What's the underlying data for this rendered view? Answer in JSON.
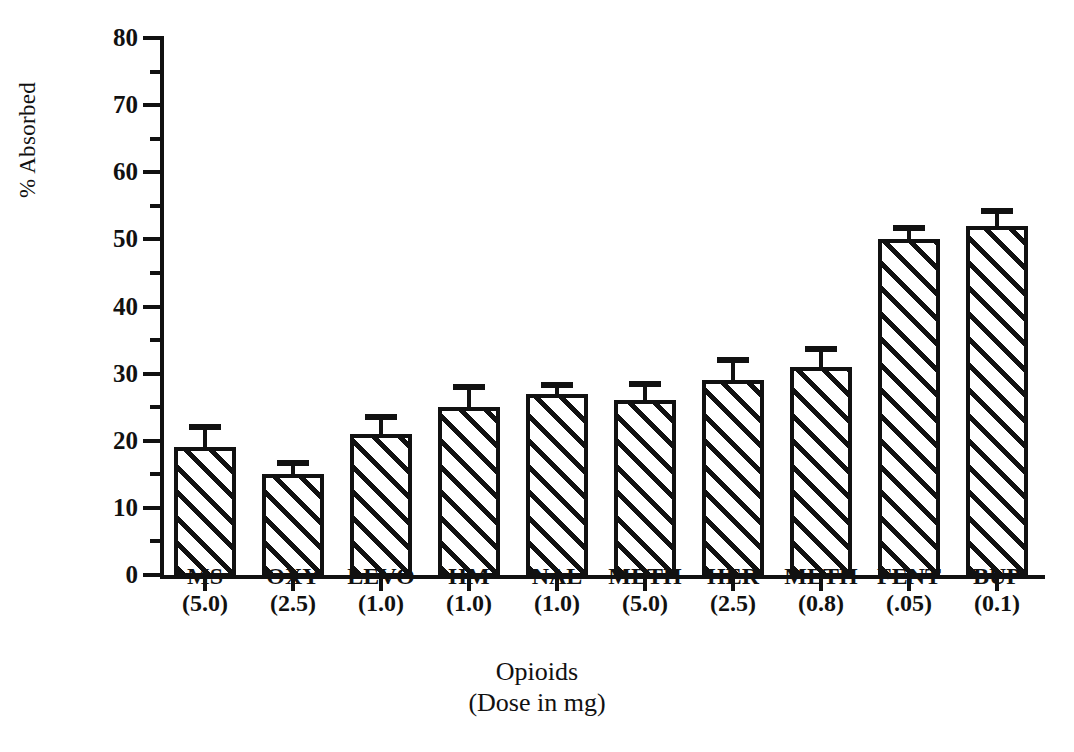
{
  "chart_data": {
    "type": "bar",
    "title": "",
    "xlabel": "Opioids",
    "xlabel_sub": "(Dose in mg)",
    "ylabel": "% Absorbed",
    "ylim": [
      0,
      80
    ],
    "ytick_major_step": 10,
    "ytick_minor_step": 5,
    "grid": false,
    "legend": false,
    "error_bars": "upper-only",
    "bar_fill": "diagonal-hatch",
    "categories": [
      "MS",
      "OXY",
      "LEVO",
      "HM",
      "NAL",
      "METH",
      "HER",
      "METH",
      "FENT",
      "BUP"
    ],
    "doses": [
      "(5.0)",
      "(2.5)",
      "(1.0)",
      "(1.0)",
      "(1.0)",
      "(5.0)",
      "(2.5)",
      "(0.8)",
      "(.05)",
      "(0.1)"
    ],
    "values": [
      19,
      15,
      21,
      25,
      27,
      26,
      29,
      31,
      50,
      52
    ],
    "errors": [
      3.0,
      1.7,
      2.5,
      3.0,
      1.3,
      2.5,
      3.0,
      2.7,
      1.7,
      2.2
    ],
    "ytick_labels": [
      "0",
      "10",
      "20",
      "30",
      "40",
      "50",
      "60",
      "70",
      "80"
    ],
    "ytick_values": [
      0,
      10,
      20,
      30,
      40,
      50,
      60,
      70,
      80
    ],
    "colors": {
      "ink": "#111111",
      "background": "#ffffff"
    }
  }
}
